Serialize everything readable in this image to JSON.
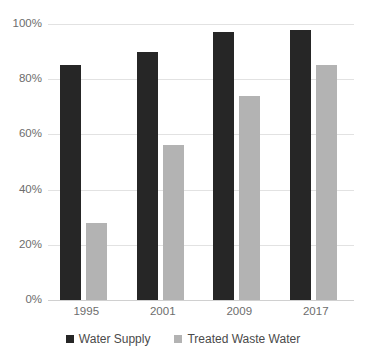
{
  "chart_data": {
    "type": "bar",
    "title": "",
    "subtitle": "",
    "xlabel": "",
    "ylabel": "",
    "categories": [
      "1995",
      "2001",
      "2009",
      "2017"
    ],
    "series": [
      {
        "name": "Water Supply",
        "color": "#262626",
        "values": [
          85,
          90,
          97,
          98
        ]
      },
      {
        "name": "Treated Waste Water",
        "color": "#b3b3b3",
        "values": [
          28,
          56,
          74,
          85
        ]
      }
    ],
    "ylim": [
      0,
      100
    ],
    "y_ticks": [
      0,
      20,
      40,
      60,
      80,
      100
    ],
    "y_tick_labels": [
      "0%",
      "20%",
      "40%",
      "60%",
      "80%",
      "100%"
    ],
    "grid": true,
    "legend_position": "bottom",
    "value_format": "percent"
  },
  "legend": {
    "items": [
      {
        "label": "Water Supply",
        "swatch": "legend-swatch-dark"
      },
      {
        "label": "Treated Waste Water",
        "swatch": "legend-swatch-gray"
      }
    ]
  },
  "colors": {
    "series_0": "#262626",
    "series_1": "#b3b3b3",
    "gridline": "#e2e2e2",
    "axis_text": "#6d6d6d",
    "background": "#ffffff"
  }
}
